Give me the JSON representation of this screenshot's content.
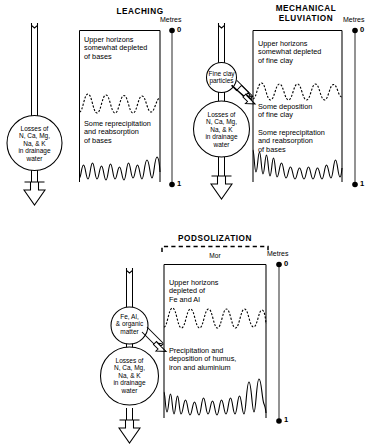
{
  "figure": {
    "caption": "Soil-forming process diagrams: leaching, mechanical eluviation and podsolization"
  },
  "panels": [
    {
      "id": "leaching",
      "title": "LEACHING",
      "scale": {
        "label": "Metres",
        "top_tick": "0",
        "bottom_tick": "1"
      },
      "circles": [
        {
          "id": "losses",
          "text": "Losses of\nN, Ca, Mg,\nNa, & K\nin drainage\nwater"
        }
      ],
      "horizon_labels": [
        {
          "id": "upper",
          "text": "Upper horizons\nsomewhat depleted\nof bases"
        },
        {
          "id": "lower",
          "text": "Some reprecipitation\nand reabsorption\nof bases"
        }
      ]
    },
    {
      "id": "mechanical-eluviation",
      "title": "MECHANICAL\nELUVIATION",
      "scale": {
        "label": "Metres",
        "top_tick": "0",
        "bottom_tick": "1"
      },
      "circles": [
        {
          "id": "fine-clay",
          "text": "Fine clay\nparticles"
        },
        {
          "id": "losses",
          "text": "Losses of\nN, Ca, Mg,\nNa, & K\nin drainage\nwater"
        }
      ],
      "horizon_labels": [
        {
          "id": "upper",
          "text": "Upper horizons\nsomewhat depleted\nof fine clay"
        },
        {
          "id": "middle",
          "text": "Some deposition\nof fine clay"
        },
        {
          "id": "lower",
          "text": "Some reprecipitation\nand reabsorption\nof bases"
        }
      ]
    },
    {
      "id": "podsolization",
      "title": "PODSOLIZATION",
      "mor_label": "Mor",
      "scale": {
        "label": "Metres",
        "top_tick": "0",
        "bottom_tick": "1"
      },
      "circles": [
        {
          "id": "fe-al-organic",
          "text": "Fe, Al,\n& organic\nmatter"
        },
        {
          "id": "losses",
          "text": "Losses of\nN, Ca, Mg,\nNa, & K\nin drainage\nwater"
        }
      ],
      "horizon_labels": [
        {
          "id": "upper",
          "text": "Upper horizons\ndepleted of\nFe and Al"
        },
        {
          "id": "lower",
          "text": "Precipitation and\ndeposition of humus,\niron and aluminium"
        }
      ]
    }
  ],
  "colors": {
    "ink": "#000000",
    "background": "#ffffff"
  }
}
